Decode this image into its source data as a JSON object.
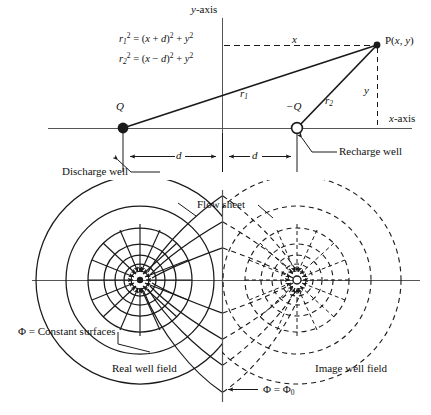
{
  "figure": {
    "ink_color": "#1a1a1a",
    "background": "#ffffff"
  },
  "upper_diagram": {
    "axes": {
      "y_axis_label": "y-axis",
      "x_axis_label": "x-axis"
    },
    "equations": [
      {
        "lhs": "r",
        "lhs_sub": "1",
        "lhs_sup": "2",
        "rhs": "= (x + d)",
        "rhs_sup": "2",
        "rhs_tail": "+ y",
        "rhs_tail_sup": "2"
      },
      {
        "lhs": "r",
        "lhs_sub": "2",
        "lhs_sup": "2",
        "rhs": "= (x − d)",
        "rhs_sup": "2",
        "rhs_tail": "+ y",
        "rhs_tail_sup": "2"
      }
    ],
    "equation_1_text": "r₁² = (x + d)² + y²",
    "equation_2_text": "r₂² = (x − d)² + y²",
    "point_label": "P(x, y)",
    "source_label": "Q",
    "sink_label": "−Q",
    "radius_1_label": "r",
    "radius_1_sub": "1",
    "radius_2_label": "r",
    "radius_2_sub": "2",
    "x_distance_label": "x",
    "y_distance_label": "y",
    "spacing_label_left": "d",
    "spacing_label_right": "d",
    "discharge_well_label": "Discharge well",
    "recharge_well_label": "Recharge well"
  },
  "lower_diagram": {
    "flow_sheet_label": "Flow sheet",
    "constant_surfaces_label": "Φ = Constant surfaces",
    "real_well_field_label": "Real well field",
    "image_well_field_label": "Image well field",
    "boundary_potential_label": "Φ = Φ",
    "boundary_potential_sub": "0",
    "real_field": {
      "style": "solid",
      "center_marker": "filled-dot",
      "equipotential_radii": [
        9,
        16,
        25,
        36,
        52,
        74,
        104
      ],
      "flow_line_count": 16
    },
    "image_field": {
      "style": "dashed",
      "center_marker": "open-circle",
      "equipotential_radii": [
        9,
        16,
        25,
        36,
        52,
        74,
        104
      ],
      "flow_line_count": 16
    }
  }
}
